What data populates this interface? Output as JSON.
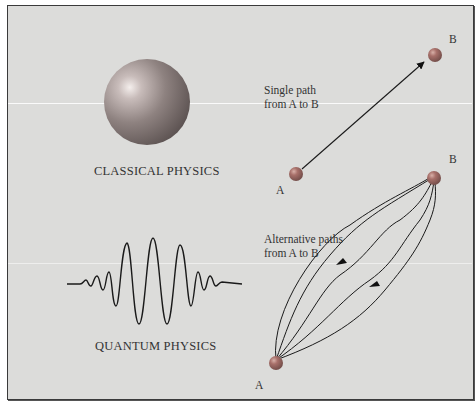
{
  "classical": {
    "caption": "CLASSICAL PHYSICS",
    "note_line1": "Single path",
    "note_line2": "from A to B",
    "point_a": "A",
    "point_b": "B"
  },
  "quantum": {
    "caption": "QUANTUM PHYSICS",
    "note_line1": "Alternative paths",
    "note_line2": "from A to B",
    "point_a": "A",
    "point_b": "B"
  },
  "colors": {
    "background": "#dcdcda",
    "border": "#3a3a3a",
    "sphere_base": "#7a6e6c",
    "particle": "#9a6a64",
    "line": "#222222"
  }
}
